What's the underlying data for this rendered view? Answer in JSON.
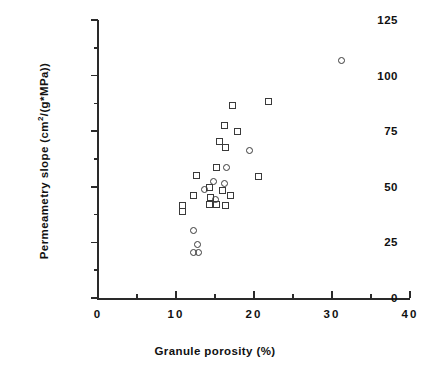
{
  "chart_data": {
    "type": "scatter",
    "title": "",
    "xlabel": "Granule porosity (%)",
    "ylabel": "Permeametry slope (cm2/(g*MPa))",
    "ylabel_parts": {
      "prefix": "Permeametry  slope  (cm",
      "superscript": "2",
      "suffix": "/(g*MPa))"
    },
    "xlim": [
      0,
      40
    ],
    "ylim": [
      0,
      125
    ],
    "xticks": [
      0,
      10,
      20,
      30,
      40
    ],
    "yticks": [
      0,
      25,
      50,
      75,
      100,
      125
    ],
    "xminorticks": [
      5,
      15,
      25,
      35
    ],
    "yminorticks": [
      12.5,
      37.5,
      62.5,
      87.5,
      112.5
    ],
    "grid": false,
    "legend": false,
    "marker_color": "#3a3a3a",
    "series": [
      {
        "name": "square-markers",
        "marker": "square",
        "points": [
          [
            10.8,
            41.5
          ],
          [
            12.6,
            55.0
          ],
          [
            12.3,
            46.0
          ],
          [
            14.3,
            49.5
          ],
          [
            14.4,
            45.0
          ],
          [
            14.3,
            42.0
          ],
          [
            15.2,
            42.0
          ],
          [
            16.4,
            41.5
          ],
          [
            15.2,
            58.5
          ],
          [
            16.0,
            48.5
          ],
          [
            17.0,
            46.0
          ],
          [
            10.8,
            39.0
          ],
          [
            16.2,
            77.5
          ],
          [
            17.2,
            86.5
          ],
          [
            17.9,
            75.0
          ],
          [
            15.6,
            70.5
          ],
          [
            16.4,
            67.5
          ],
          [
            21.8,
            88.5
          ],
          [
            20.6,
            54.5
          ]
        ]
      },
      {
        "name": "circle-markers",
        "marker": "circle",
        "points": [
          [
            12.2,
            30.5
          ],
          [
            12.8,
            24.0
          ],
          [
            12.3,
            20.5
          ],
          [
            12.9,
            20.5
          ],
          [
            13.6,
            49.0
          ],
          [
            14.8,
            52.5
          ],
          [
            15.0,
            44.5
          ],
          [
            16.2,
            51.5
          ],
          [
            16.5,
            58.5
          ],
          [
            19.4,
            66.5
          ],
          [
            31.2,
            107.0
          ]
        ]
      }
    ]
  }
}
